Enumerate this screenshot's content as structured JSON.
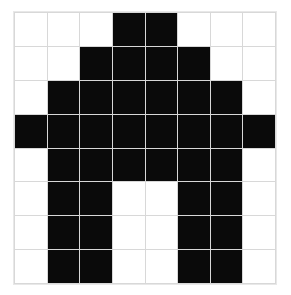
{
  "canvas": {
    "name": "pixel-grid-canvas",
    "width_cells": 8,
    "height_cells": 8,
    "background_color": "#ffffff",
    "filled_color": "#0a0a0a",
    "empty_color": "#ffffff",
    "gridline_color": "#d8d8d8",
    "border_color": "#e8e8e8",
    "cell_on_label": "filled",
    "cell_off_label": "empty"
  },
  "chart_data": {
    "type": "heatmap",
    "title": "",
    "xlabel": "",
    "ylabel": "",
    "grid": true,
    "columns": 8,
    "rows": 8,
    "legend": [
      {
        "value": 1,
        "label": "filled",
        "color": "#0a0a0a"
      },
      {
        "value": 0,
        "label": "empty",
        "color": "#ffffff"
      }
    ],
    "values": [
      [
        0,
        0,
        0,
        1,
        1,
        0,
        0,
        0
      ],
      [
        0,
        0,
        1,
        1,
        1,
        1,
        0,
        0
      ],
      [
        0,
        1,
        1,
        1,
        1,
        1,
        1,
        0
      ],
      [
        1,
        1,
        1,
        1,
        1,
        1,
        1,
        1
      ],
      [
        0,
        1,
        1,
        1,
        1,
        1,
        1,
        0
      ],
      [
        0,
        1,
        1,
        0,
        0,
        1,
        1,
        0
      ],
      [
        0,
        1,
        1,
        0,
        0,
        1,
        1,
        0
      ],
      [
        0,
        1,
        1,
        0,
        0,
        1,
        1,
        0
      ]
    ]
  }
}
